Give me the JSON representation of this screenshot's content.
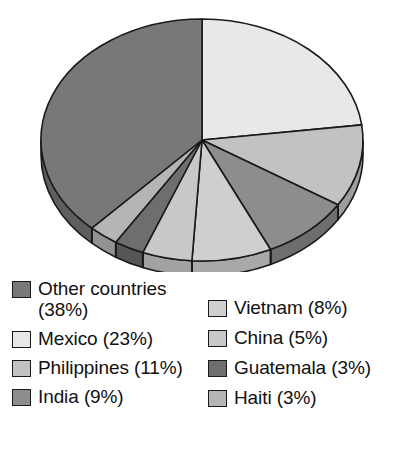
{
  "chart_data": {
    "type": "pie",
    "title": "",
    "subtitle": "",
    "style": "3d-grayscale",
    "start_angle_deg": 0,
    "direction": "clockwise",
    "legend_position": "bottom",
    "grid": false,
    "categories": [
      "Other countries",
      "Mexico",
      "Philippines",
      "India",
      "Vietnam",
      "China",
      "Guatemala",
      "Haiti"
    ],
    "values": [
      38,
      23,
      11,
      9,
      8,
      5,
      3,
      3
    ],
    "unit": "%",
    "slice_order_clockwise_from_top": [
      "Mexico",
      "Philippines",
      "India",
      "Vietnam",
      "China",
      "Guatemala",
      "Haiti",
      "Other countries"
    ],
    "slices": [
      {
        "label": "Mexico",
        "value": 23,
        "color": "#e8e8e8",
        "side_color": "#c3c3c3"
      },
      {
        "label": "Philippines",
        "value": 11,
        "color": "#c2c2c2",
        "side_color": "#9e9e9e"
      },
      {
        "label": "India",
        "value": 9,
        "color": "#8d8d8d",
        "side_color": "#6e6e6e"
      },
      {
        "label": "Vietnam",
        "value": 8,
        "color": "#cfcfcf",
        "side_color": "#a9a9a9"
      },
      {
        "label": "China",
        "value": 5,
        "color": "#c8c8c8",
        "side_color": "#a2a2a2"
      },
      {
        "label": "Guatemala",
        "value": 3,
        "color": "#6e6e6e",
        "side_color": "#565656"
      },
      {
        "label": "Haiti",
        "value": 3,
        "color": "#b5b5b5",
        "side_color": "#929292"
      },
      {
        "label": "Other countries",
        "value": 38,
        "color": "#787878",
        "side_color": "#5e5e5e"
      }
    ]
  },
  "legend": {
    "left_column": [
      {
        "label": "Other countries\n(38%)",
        "name": "Other countries",
        "percent": "38%",
        "color": "#787878"
      },
      {
        "label": "Mexico (23%)",
        "name": "Mexico",
        "percent": "23%",
        "color": "#e8e8e8"
      },
      {
        "label": "Philippines (11%)",
        "name": "Philippines",
        "percent": "11%",
        "color": "#c2c2c2"
      },
      {
        "label": "India (9%)",
        "name": "India",
        "percent": "9%",
        "color": "#8d8d8d"
      }
    ],
    "right_column": [
      {
        "label": "Vietnam (8%)",
        "name": "Vietnam",
        "percent": "8%",
        "color": "#cfcfcf"
      },
      {
        "label": "China (5%)",
        "name": "China",
        "percent": "5%",
        "color": "#c8c8c8"
      },
      {
        "label": "Guatemala (3%)",
        "name": "Guatemala",
        "percent": "3%",
        "color": "#6e6e6e"
      },
      {
        "label": "Haiti (3%)",
        "name": "Haiti",
        "percent": "3%",
        "color": "#b5b5b5"
      }
    ]
  },
  "geometry": {
    "center_x": 202,
    "center_y": 140,
    "radius_x": 161,
    "radius_y": 121,
    "depth": 15,
    "outline_color": "#1a1a1a"
  }
}
